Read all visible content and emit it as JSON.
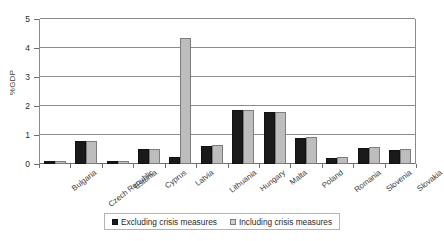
{
  "chart_data": {
    "type": "bar",
    "title": "",
    "xlabel": "",
    "ylabel": "%GDP",
    "ylim": [
      0,
      5
    ],
    "yticks": [
      0,
      1,
      2,
      3,
      4,
      5
    ],
    "grid": true,
    "legend_position": "bottom",
    "categories": [
      "Bulgaria",
      "Czech Republic",
      "Estonia",
      "Cyprus",
      "Latvia",
      "Lithuania",
      "Hungary",
      "Malta",
      "Poland",
      "Romania",
      "Slovenia",
      "Slovakia"
    ],
    "series": [
      {
        "name": "Excluding crisis measures",
        "color": "#1a1a1a",
        "values": [
          0.12,
          0.78,
          0.1,
          0.52,
          0.25,
          0.62,
          1.85,
          1.78,
          0.88,
          0.2,
          0.55,
          0.5
        ]
      },
      {
        "name": "Including crisis measures",
        "color": "#bdbdbd",
        "values": [
          0.12,
          0.8,
          0.1,
          0.52,
          4.35,
          0.65,
          1.86,
          1.78,
          0.92,
          0.25,
          0.57,
          0.52
        ]
      }
    ]
  }
}
